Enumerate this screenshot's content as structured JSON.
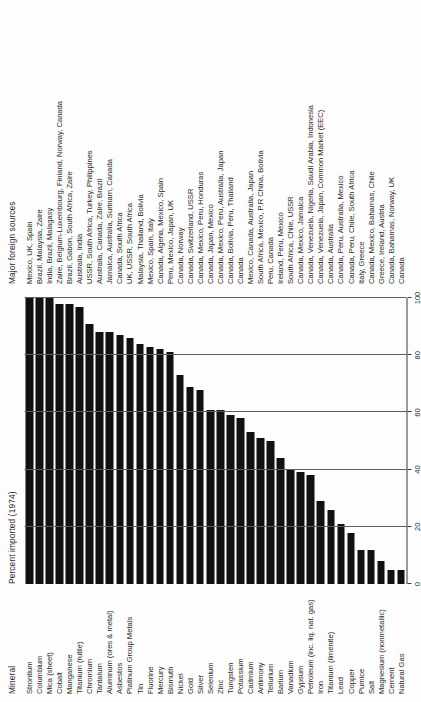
{
  "headers": {
    "mineral": "Mineral",
    "percent": "Percent imported (1974)",
    "sources": "Major foreign sources"
  },
  "axis": {
    "label": "percent",
    "ticks": [
      "0",
      "20",
      "40",
      "60",
      "80",
      "100"
    ],
    "min": 0,
    "max": 100
  },
  "chart_data": {
    "type": "bar",
    "title": "Percent imported (1974)",
    "xlabel": "percent",
    "ylabel": "Mineral",
    "xlim": [
      0,
      100
    ],
    "grid": true,
    "orientation": "horizontal",
    "categories": [
      "Strontium",
      "Columbium",
      "Mica (sheet)",
      "Cobalt",
      "Manganese",
      "Titanium (rutile)",
      "Chromium",
      "Tantalum",
      "Aluminum (ores & metal)",
      "Asbestos",
      "Platinum Group Metals",
      "Tin",
      "Fluorine",
      "Mercury",
      "Bismuth",
      "Nickel",
      "Gold",
      "Silver",
      "Selenium",
      "Zinc",
      "Tungsten",
      "Potassium",
      "Cadmium",
      "Antimony",
      "Tellurium",
      "Barium",
      "Vanadium",
      "Gypsum",
      "Petroleum (inc. liq. nat. gas)",
      "Iron",
      "Titanium (ilmenite)",
      "Lead",
      "Copper",
      "Pumice",
      "Salt",
      "Magnesium (nonmetallic)",
      "Cement",
      "Natural Gas"
    ],
    "values": [
      100,
      100,
      100,
      98,
      98,
      97,
      91,
      88,
      88,
      87,
      86,
      84,
      83,
      82,
      81,
      73,
      69,
      68,
      61,
      61,
      59,
      58,
      53,
      51,
      50,
      44,
      40,
      39,
      38,
      29,
      26,
      21,
      18,
      12,
      12,
      8,
      5,
      5
    ],
    "sources": [
      "Mexico, UK, Spain",
      "Brazil, Malaysia, Zaire",
      "India, Brazil, Malagasy",
      "Zaire, Belgium-Luxembourg, Finland, Norway, Canada",
      "Brazil, Gabon, South Africa, Zaire",
      "Australia, India",
      "USSR, South Africa, Turkey, Philippines",
      "Australia, Canada, Zaire, Brazil",
      "Jamaica, Australia, Surinam, Canada",
      "Canada, South Africa",
      "UK, USSR, South Africa",
      "Malaysia, Thailand, Bolivia",
      "Mexico, Spain, Italy",
      "Canada, Algeria, Mexico, Spain",
      "Peru, Mexico, Japan, UK",
      "Canada, Norway",
      "Canada, Switzerland, USSR",
      "Canada, Mexico, Peru, Honduras",
      "Canada, Japan, Mexico",
      "Canada, Mexico, Peru, Australia, Japan",
      "Canada, Bolivia, Peru, Thailand",
      "Canada",
      "Mexico, Canada, Australia, Japan",
      "South Africa, Mexico, P.R China, Bolivia",
      "Peru, Canada",
      "Ireland, Peru, Mexico",
      "South Africa, Chile, USSR",
      "Canada, Mexico, Jamaica",
      "Canada, Venezuela, Nigeria, Saudi Arabia, Indonesia",
      "Canada, Venezuela, Japan, Common Market (EEC)",
      "Canada, Australia",
      "Canada, Peru, Australia, Mexico",
      "Canada, Peru, Chile, South Africa",
      "Italy, Greece",
      "Canada, Mexico, Bahamas, Chile",
      "Greece, Ireland, Austria",
      "Canada, Bahamas, Norway, UK",
      "Canada"
    ]
  }
}
